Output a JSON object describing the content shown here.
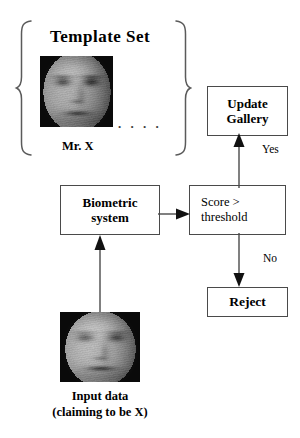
{
  "diagram": {
    "title_label": "Template  Set",
    "subject_label": "Mr. X",
    "ellipsis": ". . . .",
    "boxes": {
      "update_gallery": {
        "line1": "Update",
        "line2": "Gallery"
      },
      "biometric_system": {
        "line1": "Biometric",
        "line2": "system"
      },
      "score_threshold": {
        "line1": "Score  >",
        "line2": "threshold"
      },
      "reject": {
        "line1": "Reject"
      }
    },
    "edge_labels": {
      "yes": "Yes",
      "no": "No"
    },
    "input": {
      "caption_line1": "Input data",
      "caption_line2": "(claiming to be X)"
    },
    "icons": {
      "left_brace": "left-curly-brace",
      "right_brace": "right-curly-brace",
      "template_face": "grayscale-face-photo",
      "input_face": "grayscale-face-photo",
      "arrow_up": "arrow-up",
      "arrow_right": "arrow-right",
      "arrow_down": "arrow-down"
    },
    "colors": {
      "background": "#ffffff",
      "stroke": "#4a4a4a",
      "text": "#000000",
      "brace": "#5a5a5a"
    }
  }
}
